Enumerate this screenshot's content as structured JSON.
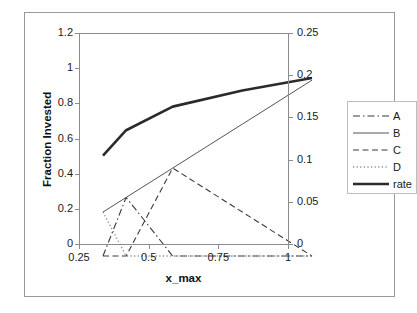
{
  "chart_data": {
    "type": "line",
    "title": "",
    "xlabel": "x_max",
    "ylabel": "Fraction Invested",
    "y2label": "",
    "xlim": [
      0.25,
      1.0
    ],
    "ylim": [
      0,
      1.2
    ],
    "y2lim": [
      0,
      0.25
    ],
    "grid": false,
    "legend_position": "right",
    "x_ticks": [
      "0.25",
      "0.5",
      "0.75",
      "1"
    ],
    "x_tick_values": [
      0.25,
      0.5,
      0.75,
      1
    ],
    "y_ticks": [
      "0",
      "0.2",
      "0.4",
      "0.6",
      "0.8",
      "1",
      "1.2"
    ],
    "y_tick_values": [
      0,
      0.2,
      0.4,
      0.6,
      0.8,
      1.0,
      1.2
    ],
    "y2_ticks": [
      "0",
      "0.05",
      "0.1",
      "0.15",
      "0.2",
      "0.25"
    ],
    "y2_tick_values": [
      0,
      0.05,
      0.1,
      0.15,
      0.2,
      0.25
    ],
    "series": [
      {
        "name": "A",
        "axis": "left",
        "style": "dash-dot",
        "color": "#3a3a3a",
        "width": 1.1,
        "x": [
          0.25,
          0.333,
          0.5,
          0.75,
          1.0
        ],
        "y": [
          0.0,
          0.333,
          0.0,
          0.0,
          0.0
        ]
      },
      {
        "name": "B",
        "axis": "left",
        "style": "solid",
        "color": "#555555",
        "width": 1.0,
        "x": [
          0.25,
          0.333,
          0.5,
          0.75,
          1.0
        ],
        "y": [
          0.25,
          0.333,
          0.5,
          0.75,
          1.0
        ]
      },
      {
        "name": "C",
        "axis": "left",
        "style": "dashed",
        "color": "#3a3a3a",
        "width": 1.1,
        "x": [
          0.25,
          0.333,
          0.5,
          0.75,
          1.0
        ],
        "y": [
          0.0,
          0.0,
          0.5,
          0.25,
          0.0
        ]
      },
      {
        "name": "D",
        "axis": "left",
        "style": "dotted",
        "color": "#8a8a8a",
        "width": 1.4,
        "x": [
          0.25,
          0.333,
          0.5,
          0.75,
          1.0
        ],
        "y": [
          0.25,
          0.0,
          0.0,
          0.0,
          0.0
        ]
      },
      {
        "name": "rate",
        "axis": "right",
        "style": "solid",
        "color": "#2b2b2b",
        "width": 2.6,
        "x": [
          0.25,
          0.333,
          0.5,
          0.75,
          1.0
        ],
        "y": [
          0.119,
          0.149,
          0.177,
          0.196,
          0.211
        ]
      }
    ],
    "legend": [
      {
        "label": "A",
        "style": "dash-dot",
        "color": "#3a3a3a",
        "width": 1.1
      },
      {
        "label": "B",
        "style": "solid",
        "color": "#555555",
        "width": 1.0
      },
      {
        "label": "C",
        "style": "dashed",
        "color": "#3a3a3a",
        "width": 1.1
      },
      {
        "label": "D",
        "style": "dotted",
        "color": "#8a8a8a",
        "width": 1.4
      },
      {
        "label": "rate",
        "style": "solid",
        "color": "#2b2b2b",
        "width": 2.6
      }
    ]
  }
}
